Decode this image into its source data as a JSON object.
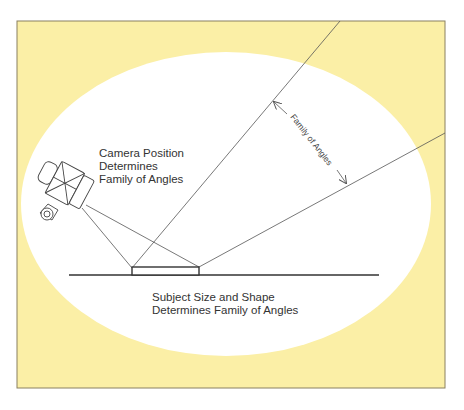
{
  "figure": {
    "colors": {
      "panel_fill": "#fbefa6",
      "panel_border": "#8a8060",
      "ellipse_fill": "#ffffff",
      "line": "#555555",
      "heavy_line": "#333333",
      "text": "#333333"
    },
    "labels": {
      "camera_line1": "Camera Position",
      "camera_line2": "Determines",
      "camera_line3": "Family of Angles",
      "subject_line1": "Subject Size and Shape",
      "subject_line2": "Determines Family of Angles",
      "angle_label": "Family of Angles"
    },
    "elements": [
      "camera",
      "subject-box",
      "baseline",
      "ray-left",
      "ray-right",
      "angle-arrow"
    ]
  }
}
